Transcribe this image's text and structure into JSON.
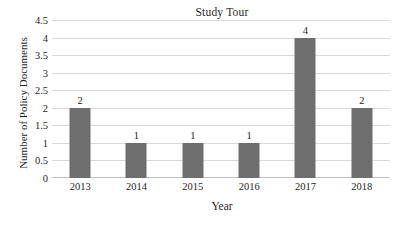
{
  "chart_data": {
    "type": "bar",
    "title": "Study Tour",
    "xlabel": "Year",
    "ylabel": "Number of Policy Documents",
    "categories": [
      "2013",
      "2014",
      "2015",
      "2016",
      "2017",
      "2018"
    ],
    "values": [
      2,
      1,
      1,
      1,
      4,
      2
    ],
    "data_labels": [
      "2",
      "1",
      "1",
      "1",
      "4",
      "2"
    ],
    "ylim": [
      0,
      4.5
    ],
    "ytick_labels": [
      "0",
      "0.5",
      "1",
      "1.5",
      "2",
      "2.5",
      "3",
      "3.5",
      "4",
      "4.5"
    ],
    "ytick_values": [
      0,
      0.5,
      1,
      1.5,
      2,
      2.5,
      3,
      3.5,
      4,
      4.5
    ],
    "grid": true,
    "grid_axis": "y",
    "legend": false,
    "legend_position": "none",
    "bar_color": "#6e6e6e",
    "gridline_color": "#d9d9d9",
    "background_color": "#ffffff",
    "text_color": "#1f1f1f"
  }
}
